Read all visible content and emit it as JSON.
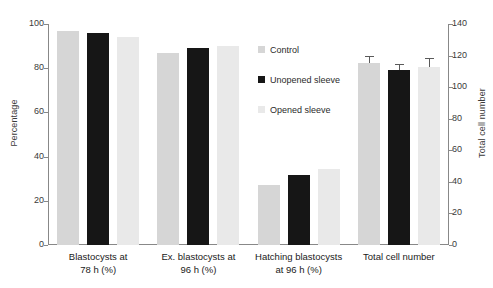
{
  "chart_data": {
    "type": "bar",
    "title": "",
    "categories": [
      "Blastocysts at\n78 h (%)",
      "Ex. blastocysts at\n96 h (%)",
      "Hatching blastocysts\nat 96 h (%)",
      "Total cell number"
    ],
    "category_lines": [
      [
        "Blastocysts at",
        "78 h (%)"
      ],
      [
        "Ex. blastocysts at",
        "96 h (%)"
      ],
      [
        "Hatching blastocysts",
        "at 96 h (%)"
      ],
      [
        "Total cell number",
        ""
      ]
    ],
    "series": [
      {
        "name": "Control",
        "color": "#d6d6d6",
        "values": [
          97,
          87,
          27,
          115
        ],
        "errors": [
          null,
          null,
          null,
          4
        ]
      },
      {
        "name": "Unopened sleeve",
        "color": "#161616",
        "values": [
          96,
          89,
          31.5,
          111
        ],
        "errors": [
          null,
          null,
          null,
          3
        ]
      },
      {
        "name": "Opened sleeve",
        "color": "#e9e9e9",
        "values": [
          94,
          90,
          34.5,
          113
        ],
        "errors": [
          null,
          null,
          null,
          5
        ]
      }
    ],
    "xlabel": "",
    "ylabel": "Percentage",
    "y2label": "Total cell number",
    "ylim": [
      0,
      100
    ],
    "y2lim": [
      0,
      140
    ],
    "yticks": [
      0,
      20,
      40,
      60,
      80,
      100
    ],
    "y2ticks": [
      0,
      20,
      40,
      60,
      80,
      100,
      120,
      140
    ],
    "grid": false,
    "legend_position": "upper center",
    "note": "Groups 1-3 read on the left percentage axis; group 4 reads on the right total cell number axis."
  },
  "axes": {
    "left": {
      "title": "Percentage",
      "ticks": [
        "0",
        "20",
        "40",
        "60",
        "80",
        "100"
      ]
    },
    "right": {
      "title": "Total cell number",
      "ticks": [
        "0",
        "20",
        "40",
        "60",
        "80",
        "100",
        "120",
        "140"
      ]
    }
  },
  "legend": {
    "items": [
      {
        "label": "Control"
      },
      {
        "label": "Unopened sleeve"
      },
      {
        "label": "Opened sleeve"
      }
    ]
  }
}
